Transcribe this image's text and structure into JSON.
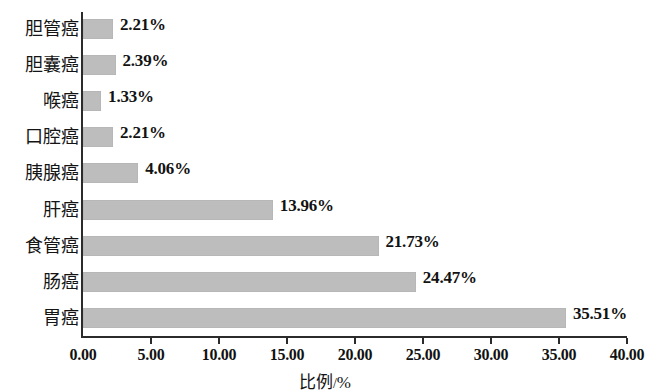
{
  "chart_data": {
    "type": "bar",
    "orientation": "horizontal",
    "title": "",
    "subtitle": "",
    "xlabel": "比例 / %",
    "ylabel": "",
    "categories": [
      "胆管癌",
      "胆囊癌",
      "喉癌",
      "口腔癌",
      "胰腺癌",
      "肝癌",
      "食管癌",
      "肠癌",
      "胃癌"
    ],
    "values": [
      2.21,
      2.39,
      1.33,
      2.21,
      4.06,
      13.96,
      21.73,
      24.47,
      35.51
    ],
    "value_labels": [
      "2.21%",
      "2.39%",
      "1.33%",
      "2.21%",
      "4.06%",
      "13.96%",
      "21.73%",
      "24.47%",
      "35.51%"
    ],
    "xlim": [
      0,
      40
    ],
    "xticks": [
      0,
      5,
      10,
      15,
      20,
      25,
      30,
      35,
      40
    ],
    "xtick_labels": [
      "0.00",
      "5.00",
      "10.00",
      "15.00",
      "20.00",
      "25.00",
      "30.00",
      "35.00",
      "40.00"
    ],
    "grid": false,
    "legend": "none",
    "bar_color": "#bdbdbd",
    "axis_color": "#2b2b2b",
    "text_color": "#141414",
    "background": "#ffffff"
  },
  "axis_title": {
    "name": "比例",
    "separator": "/",
    "unit": "%"
  }
}
